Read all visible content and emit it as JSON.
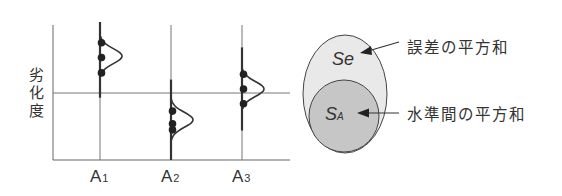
{
  "chart_data": {
    "type": "scatter",
    "title": "",
    "ylabel": "劣化度",
    "xlabel": "",
    "categories": [
      {
        "main": "A",
        "sub": "1"
      },
      {
        "main": "A",
        "sub": "2"
      },
      {
        "main": "A",
        "sub": "3"
      }
    ],
    "grand_mean": 0,
    "ylim": [
      -1.0,
      1.0
    ],
    "grid": "horizontal line at grand mean",
    "series": [
      {
        "name": "A1",
        "points": [
          0.75,
          0.53,
          0.3
        ],
        "mean": 0.55,
        "spread_range": [
          -0.07,
          1.07
        ]
      },
      {
        "name": "A2",
        "points": [
          -0.27,
          -0.46,
          -0.55
        ],
        "mean": -0.4,
        "spread_range": [
          -1.0,
          0.2
        ]
      },
      {
        "name": "A3",
        "points": [
          0.28,
          0.06,
          -0.16
        ],
        "mean": 0.06,
        "spread_range": [
          -0.56,
          0.68
        ]
      }
    ],
    "distribution_curves": "normal-shaped bumps drawn to the right of each level line, centered at level mean"
  },
  "venn": {
    "outer": {
      "symbol": "Se",
      "label": "誤差の平方和",
      "fill": "#e9e9e9"
    },
    "inner": {
      "symbol": "S",
      "symbol_sub": "A",
      "label": "水準間の平方和",
      "fill": "#c6c6c6"
    }
  },
  "colors": {
    "stroke": "#333333",
    "axis": "#555555",
    "background": "#ffffff"
  }
}
